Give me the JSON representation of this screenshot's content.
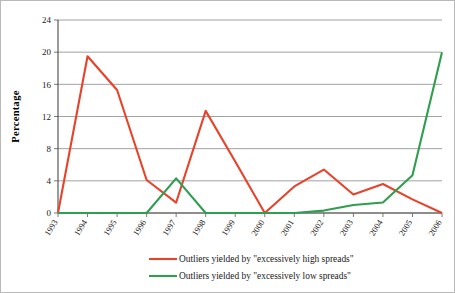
{
  "chart_data": {
    "type": "line",
    "title": "",
    "subtitle": "",
    "xlabel": "",
    "ylabel": "Percentage",
    "categories": [
      "1993",
      "1994",
      "1995",
      "1996",
      "1997",
      "1998",
      "1999",
      "2000",
      "2001",
      "2002",
      "2003",
      "2004",
      "2005",
      "2006"
    ],
    "x": [
      "1993",
      "1994",
      "1995",
      "1996",
      "1997",
      "1998",
      "1999",
      "2000",
      "2001",
      "2002",
      "2003",
      "2004",
      "2005",
      "2006"
    ],
    "ylim": [
      0,
      24
    ],
    "yticks": [
      0,
      4,
      8,
      12,
      16,
      20,
      24
    ],
    "ytick_labels": [
      "0",
      "4",
      "8",
      "12",
      "16",
      "20",
      "24"
    ],
    "grid": "horizontal",
    "legend_position": "bottom-center",
    "series": [
      {
        "name": "Outliers yielded by \"excessively high spreads\"",
        "color": "#e8432a",
        "values": [
          0,
          19.5,
          15.3,
          4.1,
          1.3,
          12.7,
          6.4,
          0,
          3.3,
          5.4,
          2.3,
          3.6,
          1.7,
          0
        ]
      },
      {
        "name": "Outliers yielded by \"excessively low spreads\"",
        "color": "#2f9e4f",
        "values": [
          0,
          0,
          0,
          0,
          4.3,
          0,
          0,
          0,
          0,
          0.3,
          1.0,
          1.3,
          4.7,
          20.0
        ]
      }
    ]
  },
  "legend": {
    "entries": [
      {
        "label": "Outliers yielded by \"excessively high spreads\"",
        "color": "#e8432a"
      },
      {
        "label": "Outliers yielded by \"excessively low spreads\"",
        "color": "#2f9e4f"
      }
    ]
  },
  "axes": {
    "y_axis_title": "Percentage"
  },
  "colors": {
    "high_spreads": "#e8432a",
    "low_spreads": "#2f9e4f",
    "gridline": "#8a8a8a",
    "axis": "#4a4a4a",
    "frame_border": "#b9b9b9",
    "background": "#ffffff"
  }
}
